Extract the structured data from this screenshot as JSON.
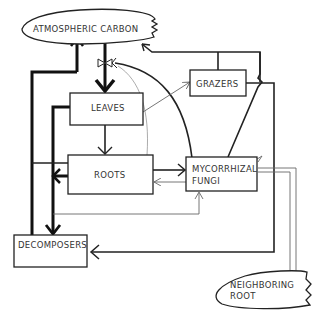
{
  "diagram": {
    "nodes": {
      "atmospheric_carbon": "ATMOSPHERIC CARBON",
      "leaves": "LEAVES",
      "grazers": "GRAZERS",
      "roots": "ROOTS",
      "mycorrhizal_line1": "MYCORRHIZAL",
      "mycorrhizal_line2": "FUNGI",
      "decomposers": "DECOMPOSERS",
      "neighboring_line1": "NEIGHBORING",
      "neighboring_line2": "ROOT"
    },
    "edges": [
      {
        "from": "ATMOSPHERIC CARBON",
        "to": "LEAVES",
        "weight": "thick",
        "valve": true
      },
      {
        "from": "LEAVES",
        "to": "ATMOSPHERIC CARBON",
        "weight": "thick"
      },
      {
        "from": "LEAVES",
        "to": "GRAZERS",
        "weight": "thin"
      },
      {
        "from": "LEAVES",
        "to": "ROOTS",
        "weight": "medium"
      },
      {
        "from": "LEAVES",
        "to": "DECOMPOSERS",
        "weight": "thick"
      },
      {
        "from": "ROOTS",
        "to": "MYCORRHIZAL FUNGI",
        "weight": "medium"
      },
      {
        "from": "MYCORRHIZAL FUNGI",
        "to": "ROOTS",
        "weight": "thin"
      },
      {
        "from": "ROOTS",
        "to": "DECOMPOSERS",
        "weight": "thick"
      },
      {
        "from": "DECOMPOSERS",
        "to": "ATMOSPHERIC CARBON",
        "weight": "thick"
      },
      {
        "from": "GRAZERS",
        "to": "ATMOSPHERIC CARBON",
        "weight": "medium"
      },
      {
        "from": "GRAZERS",
        "to": "DECOMPOSERS",
        "weight": "medium"
      },
      {
        "from": "MYCORRHIZAL FUNGI",
        "to": "ATMOSPHERIC CARBON",
        "weight": "medium"
      },
      {
        "from": "MYCORRHIZAL FUNGI",
        "to": "NEIGHBORING ROOT",
        "weight": "double-thin"
      },
      {
        "from": "DECOMPOSERS",
        "to": "MYCORRHIZAL FUNGI",
        "weight": "thin"
      }
    ]
  }
}
